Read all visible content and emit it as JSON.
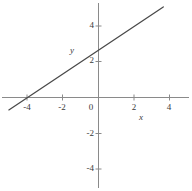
{
  "chart_data": {
    "type": "line",
    "title": "",
    "xlabel": "x",
    "ylabel": "y",
    "xlim": [
      -5.05,
      5.25
    ],
    "ylim": [
      -5.2,
      5.3
    ],
    "grid": false,
    "legend": null,
    "axis_color": "#8a8a8a",
    "line_color": "#4a4a4a",
    "text_color": "#3a3a3a",
    "background": "#ffffff",
    "xticks": [
      -4,
      -2,
      2,
      4
    ],
    "xtick_labels": [
      "-4",
      "-2",
      "2",
      "4"
    ],
    "yticks": [
      4,
      2,
      -2,
      -4
    ],
    "ytick_labels": [
      "4",
      "2",
      "-2",
      "-4"
    ],
    "origin_label": "0",
    "series": [
      {
        "name": "line",
        "equation": "y = (2/3)x + 8/3",
        "slope": 0.667,
        "intercept": 2.667,
        "x_intercept": -4,
        "y_intercept": 2.667,
        "points": [
          {
            "x": -5.05,
            "y": -0.7
          },
          {
            "x": -4,
            "y": 0
          },
          {
            "x": 0,
            "y": 2.667
          },
          {
            "x": 3.65,
            "y": 5.1
          }
        ]
      }
    ]
  }
}
